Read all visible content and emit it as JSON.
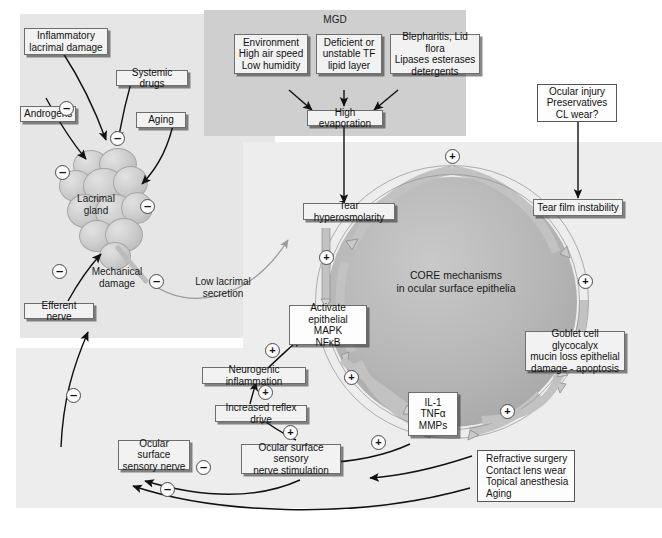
{
  "panels": {
    "mgd_label": "MGD",
    "core_label": "CORE mechanisms\nin ocular surface epithelia"
  },
  "nodes": {
    "inflammatory_lacrimal_damage": "Inflammatory\nlacrimal damage",
    "systemic_drugs": "Systemic drugs",
    "androgens": "Androgens",
    "aging_left": "Aging",
    "lacrimal_gland": "Lacrimal\ngland",
    "mechanical_damage": "Mechanical\ndamage",
    "low_lacrimal_secretion": "Low lacrimal\nsecretion",
    "efferent_nerve": "Efferent nerve",
    "environment": "Environment\nHigh air speed\nLow humidity",
    "deficient_tf": "Deficient or\nunstable TF\nlipid layer",
    "blepharitis": "Blepharitis, Lid flora\nLipases esterases\ndetergents",
    "high_evaporation": "High evaporation",
    "ocular_injury": "Ocular injury\nPreservatives\nCL wear?",
    "tear_hyperosmolarity": "Tear hyperosmolarity",
    "tear_film_instability": "Tear film instability",
    "activate_epithelial": "Activate epithelial\nMAPK\nNFκB",
    "goblet_cell": "Goblet cell glycocalyx\nmucin loss epithelial\ndamage - apoptosis",
    "il1_tnf_mmp": "IL-1\nTNFα\nMMPs",
    "neurogenic_inflammation": "Neurogenic inflammation",
    "increased_reflex_drive": "Increased reflex drive",
    "ocular_surface_sensory_nerve": "Ocular surface\nsensory nerve",
    "ocular_surface_sensory_nerve_stimulation": "Ocular surface sensory\nnerve stimulation",
    "refractive_surgery": "Refractive surgery\nContact lens wear\nTopical anesthesia\nAging"
  },
  "signs": {
    "minus": "–",
    "plus": "+",
    "minus_list": [
      {
        "id": "inflammatory-to-gland",
        "value": "–"
      },
      {
        "id": "systemic-drugs-to-gland",
        "value": "–"
      },
      {
        "id": "androgens-to-gland",
        "value": "–"
      },
      {
        "id": "aging-to-gland",
        "value": "–"
      },
      {
        "id": "mechanical-damage",
        "value": "–"
      },
      {
        "id": "efferent-nerve",
        "value": "–"
      },
      {
        "id": "sensory-nerve-upper",
        "value": "–"
      },
      {
        "id": "sensory-nerve-lower",
        "value": "–"
      },
      {
        "id": "sensory-nerve-feedback",
        "value": "–"
      }
    ],
    "plus_list": [
      {
        "id": "ring-top",
        "value": "+"
      },
      {
        "id": "ring-left-upper",
        "value": "+"
      },
      {
        "id": "ring-right-upper",
        "value": "+"
      },
      {
        "id": "ring-left-lower",
        "value": "+"
      },
      {
        "id": "ring-right-lower",
        "value": "+"
      },
      {
        "id": "neurogenic-to-activate",
        "value": "+"
      },
      {
        "id": "reflex-to-neurogenic",
        "value": "+"
      },
      {
        "id": "stimulation-to-reflex",
        "value": "+"
      },
      {
        "id": "il1-to-stimulation",
        "value": "+"
      }
    ]
  },
  "colors": {
    "panel_left_bg": "#e6e6e6",
    "panel_mgd_bg": "#cfcfcf",
    "panel_core_bg": "#ededed",
    "panel_bottom_bg": "#ededed",
    "circle_fill": "#b9b9b9",
    "ring_band": "#c2c2c2",
    "box_bg": "#f2f2f2",
    "box_border": "#6e6e6e",
    "arrow_black": "#111111",
    "arrow_gray": "#9a9a9a"
  }
}
